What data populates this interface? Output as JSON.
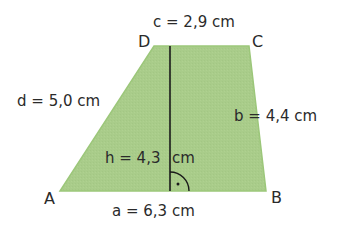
{
  "figure": {
    "type": "trapezoid",
    "fill_color": "#a9cc8a",
    "edge_color": "#8fbf6a",
    "height_line_color": "#1a1a1a",
    "vertices": {
      "A": {
        "label": "A",
        "x": 60,
        "y": 191
      },
      "B": {
        "label": "B",
        "x": 266,
        "y": 191
      },
      "C": {
        "label": "C",
        "x": 249,
        "y": 46
      },
      "D": {
        "label": "D",
        "x": 154,
        "y": 46
      }
    },
    "sides": {
      "a": "a = 6,3 cm",
      "b": "b = 4,4 cm",
      "c": "c = 2,9 cm",
      "d": "d = 5,0 cm"
    },
    "height": {
      "label": "h = 4,3 cm",
      "label_left": "h = 4,3",
      "label_right": "cm",
      "x": 170,
      "y_top": 46,
      "y_bottom": 191
    },
    "right_angle_marker": "right-angle-arc-with-dot"
  }
}
